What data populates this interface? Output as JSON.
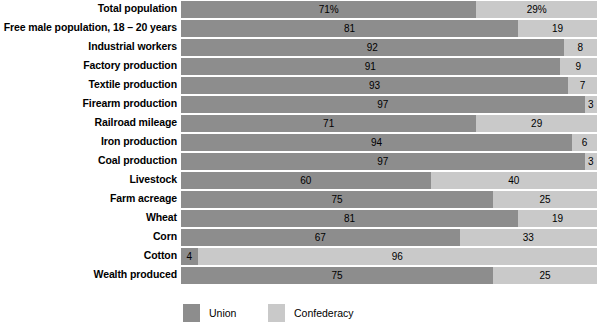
{
  "chart_data": {
    "type": "bar",
    "title": "",
    "subtitle": "",
    "xlabel": "",
    "ylabel": "",
    "orientation": "horizontal",
    "stacked": true,
    "normalized": true,
    "xlim": [
      0,
      100
    ],
    "grid": false,
    "legend_position": "bottom-left",
    "categories": [
      "Total population",
      "Free male population, 18 – 20 years",
      "Industrial workers",
      "Factory production",
      "Textile production",
      "Firearm production",
      "Railroad mileage",
      "Iron production",
      "Coal production",
      "Livestock",
      "Farm acreage",
      "Wheat",
      "Corn",
      "Cotton",
      "Wealth produced"
    ],
    "series": [
      {
        "name": "Union",
        "color": "#8d8d8d",
        "values": [
          71,
          81,
          92,
          91,
          93,
          97,
          71,
          94,
          97,
          60,
          75,
          81,
          67,
          4,
          75
        ],
        "labels": [
          "71%",
          "81",
          "92",
          "91",
          "93",
          "97",
          "71",
          "94",
          "97",
          "60",
          "75",
          "81",
          "67",
          "4",
          "75"
        ]
      },
      {
        "name": "Confederacy",
        "color": "#c9c9c9",
        "values": [
          29,
          19,
          8,
          9,
          7,
          3,
          29,
          6,
          3,
          40,
          25,
          19,
          33,
          96,
          25
        ],
        "labels": [
          "29%",
          "19",
          "8",
          "9",
          "7",
          "3",
          "29",
          "6",
          "3",
          "40",
          "25",
          "19",
          "33",
          "96",
          "25"
        ]
      }
    ]
  },
  "legend": {
    "items": [
      {
        "label": "Union",
        "color": "#8d8d8d"
      },
      {
        "label": "Confederacy",
        "color": "#c9c9c9"
      }
    ]
  }
}
